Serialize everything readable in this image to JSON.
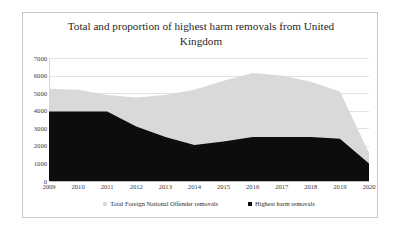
{
  "chart_data": {
    "type": "area",
    "title": "Total and proportion of highest harm removals from United Kingdom",
    "xlabel": "",
    "ylabel": "",
    "ylim": [
      0,
      7000
    ],
    "ytick_step": 1000,
    "yticks": [
      "0",
      "1000",
      "2000",
      "3000",
      "4000",
      "5000",
      "6000",
      "7000"
    ],
    "grid": true,
    "legend_position": "bottom",
    "stacked": true,
    "categories": [
      "2009",
      "2010",
      "2011",
      "2012",
      "2013",
      "2014",
      "2015",
      "2016",
      "2017",
      "2018",
      "2019",
      "2020"
    ],
    "series": [
      {
        "name": "Total Foreign National Offender removals",
        "color": "#d9d9d9",
        "values": [
          5250,
          5200,
          4900,
          4750,
          4900,
          5200,
          5700,
          6150,
          6000,
          5650,
          5100,
          1600
        ]
      },
      {
        "name": "Highest harm removals",
        "color": "#0d0d0d",
        "values": [
          3950,
          3950,
          3950,
          3100,
          2500,
          2050,
          2250,
          2500,
          2500,
          2500,
          2400,
          1000
        ]
      }
    ]
  },
  "legend": {
    "items": [
      {
        "label": "Total Foreign National Offender removals",
        "color": "#d9d9d9"
      },
      {
        "label": "Highest harm removals",
        "color": "#0d0d0d"
      }
    ]
  }
}
